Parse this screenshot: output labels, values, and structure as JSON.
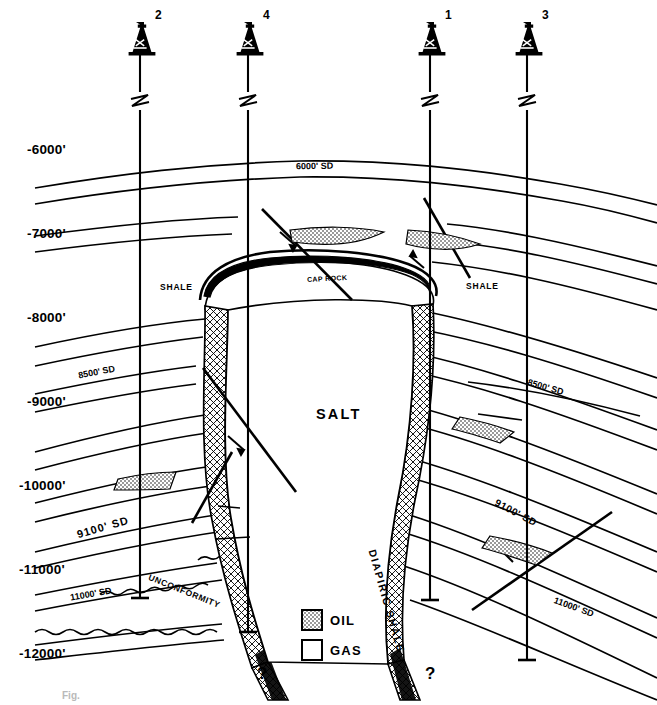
{
  "figure": {
    "kind": "geologic-cross-section",
    "title_caption": "Fig.",
    "depth_axis": {
      "unit_note": "feet subsea",
      "ticks": [
        "-6000'",
        "-7000'",
        "-8000'",
        "-9000'",
        "-10000'",
        "-11000'",
        "-12000'"
      ]
    },
    "wells": [
      {
        "number": "2",
        "x": 140
      },
      {
        "number": "4",
        "x": 248
      },
      {
        "number": "1",
        "x": 430
      },
      {
        "number": "3",
        "x": 527
      }
    ],
    "structure_labels": {
      "salt": "SALT",
      "cap_rock": "CAP ROCK",
      "diapiric_shale": "DIAPIRIC SHALE",
      "shale_left": "SHALE",
      "shale_right": "SHALE",
      "unconformity": "UNCONFORMITY"
    },
    "sand_labels": {
      "sd_6000": "6000' SD",
      "sd_8500_left": "8500' SD",
      "sd_8500_right": "8500' SD",
      "sd_9100_left": "9100' SD",
      "sd_9100_right": "9100' SD",
      "sd_11000_left": "11000' SD",
      "sd_11000_right": "11000' SD"
    },
    "uncertainty_marks": [
      "?",
      "?"
    ],
    "legend": {
      "items": [
        {
          "label": "OIL",
          "fill": "stipple-gray"
        },
        {
          "label": "GAS",
          "fill": "white"
        }
      ]
    },
    "colors": {
      "ink": "#000000",
      "oil_fill": "#b8b8b8",
      "paper": "#ffffff"
    }
  }
}
